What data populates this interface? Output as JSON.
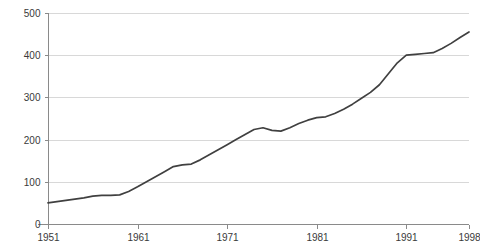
{
  "chart_data": {
    "type": "line",
    "title": "",
    "subtitle": "",
    "xlabel": "",
    "ylabel": "",
    "xlim": [
      1951,
      1998
    ],
    "ylim": [
      0,
      500
    ],
    "grid": true,
    "legend": false,
    "legend_position": "none",
    "line_color": "#404040",
    "gridline_color": "#d8d8d8",
    "axis_color": "#8a8a8a",
    "background_color": "#ffffff",
    "x_ticks": [
      1951,
      1961,
      1971,
      1981,
      1991,
      1998
    ],
    "x_tick_labels": [
      "1951",
      "1961",
      "1971",
      "1981",
      "1991",
      "1998"
    ],
    "y_ticks": [
      0,
      100,
      200,
      300,
      400,
      500
    ],
    "y_tick_labels": [
      "0",
      "100",
      "200",
      "300",
      "400",
      "500"
    ],
    "x": [
      1951,
      1952,
      1953,
      1954,
      1955,
      1956,
      1957,
      1958,
      1959,
      1960,
      1961,
      1962,
      1963,
      1964,
      1965,
      1966,
      1967,
      1968,
      1969,
      1970,
      1971,
      1972,
      1973,
      1974,
      1975,
      1976,
      1977,
      1978,
      1979,
      1980,
      1981,
      1982,
      1983,
      1984,
      1985,
      1986,
      1987,
      1988,
      1989,
      1990,
      1991,
      1992,
      1993,
      1994,
      1995,
      1996,
      1997,
      1998
    ],
    "values": [
      50,
      53,
      56,
      59,
      62,
      66,
      68,
      68,
      69,
      77,
      88,
      100,
      112,
      124,
      136,
      140,
      142,
      152,
      164,
      176,
      188,
      200,
      212,
      224,
      228,
      222,
      220,
      228,
      238,
      246,
      252,
      254,
      262,
      272,
      284,
      298,
      312,
      330,
      356,
      382,
      400,
      402,
      404,
      406,
      416,
      428,
      442,
      455
    ],
    "series": [
      {
        "name": "series-1",
        "color": "#404040",
        "values": [
          50,
          53,
          56,
          59,
          62,
          66,
          68,
          68,
          69,
          77,
          88,
          100,
          112,
          124,
          136,
          140,
          142,
          152,
          164,
          176,
          188,
          200,
          212,
          224,
          228,
          222,
          220,
          228,
          238,
          246,
          252,
          254,
          262,
          272,
          284,
          298,
          312,
          330,
          356,
          382,
          400,
          402,
          404,
          406,
          416,
          428,
          442,
          455
        ]
      }
    ]
  }
}
